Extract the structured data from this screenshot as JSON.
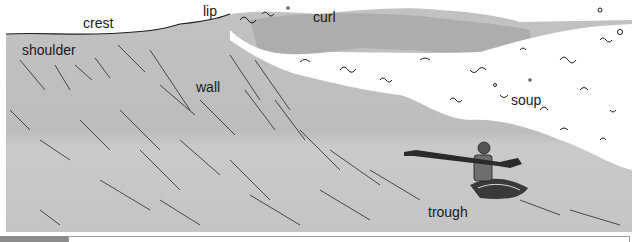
{
  "figure": {
    "labels": {
      "crest": "crest",
      "lip": "lip",
      "curl": "curl",
      "shoulder": "shoulder",
      "wall": "wall",
      "soup": "soup",
      "trough": "trough"
    },
    "colors": {
      "water": "#bdbdbd",
      "water_light": "#cfcfcf",
      "foam": "#ffffff",
      "ink": "#1e1e1e",
      "caption_tab": "#8c8c8c"
    }
  },
  "caption": {
    "tab_color": "#8c8c8c",
    "text": ""
  }
}
